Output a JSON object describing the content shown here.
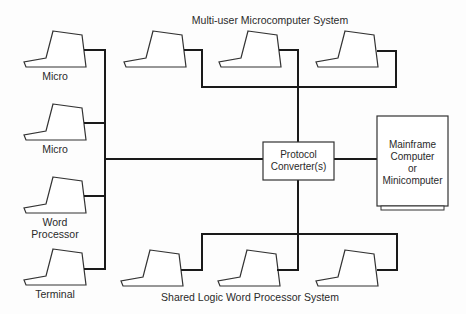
{
  "diagram": {
    "top_group_label": "Multi-user Microcomputer System",
    "bottom_group_label": "Shared Logic Word Processor System",
    "left_devices": [
      {
        "label": "Micro"
      },
      {
        "label": "Micro"
      },
      {
        "label": "Word\nProcessor"
      },
      {
        "label": "Terminal"
      }
    ],
    "hub": {
      "label": "Protocol\nConverter(s)"
    },
    "host": {
      "label": "Mainframe\nComputer\nor\nMinicomputer"
    },
    "top_devices_count": 3,
    "bottom_devices_count": 3,
    "colors": {
      "line": "#1a1a1a",
      "background": "#fdfdfd"
    }
  }
}
